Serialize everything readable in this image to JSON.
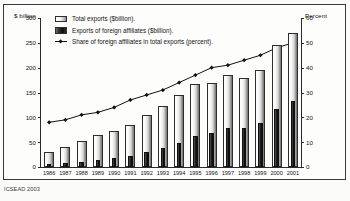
{
  "figure": {
    "left_axis_title": "$ billion",
    "right_axis_title": "Percent",
    "footer_note": "ICSEAD 2003"
  },
  "legend": {
    "items": [
      {
        "key": "total",
        "label": "Total exports ($billion)."
      },
      {
        "key": "affiliates",
        "label": "Exports of foreign affiliates ($billion)."
      },
      {
        "key": "share",
        "label": "Share of foreign affiliates in total exports (percent)."
      }
    ]
  },
  "chart_data": {
    "type": "bar",
    "title": "",
    "xlabel": "",
    "ylabel": "$ billion",
    "y2label": "Percent",
    "ylim": [
      0,
      300
    ],
    "y2lim": [
      0,
      60
    ],
    "yticks": [
      0,
      50,
      100,
      150,
      200,
      250,
      300
    ],
    "y2ticks": [
      0,
      10,
      20,
      30,
      40,
      50,
      60
    ],
    "grid": false,
    "legend_position": "top-left",
    "categories": [
      "1986",
      "1987",
      "1988",
      "1989",
      "1990",
      "1991",
      "1992",
      "1993",
      "1994",
      "1995",
      "1996",
      "1997",
      "1998",
      "1999",
      "2000",
      "2001"
    ],
    "series": [
      {
        "name": "Total exports ($billion).",
        "type": "bar",
        "axis": "left",
        "values": [
          31,
          40,
          52,
          64,
          73,
          85,
          104,
          122,
          145,
          168,
          170,
          185,
          180,
          195,
          245,
          270
        ]
      },
      {
        "name": "Exports of foreign affiliates ($billion).",
        "type": "bar",
        "axis": "left",
        "values": [
          6,
          8,
          11,
          14,
          18,
          23,
          30,
          38,
          49,
          62,
          68,
          79,
          78,
          88,
          117,
          133
        ]
      },
      {
        "name": "Share of foreign affiliates in total exports (percent).",
        "type": "line",
        "axis": "right",
        "values": [
          18,
          19,
          21,
          22,
          24,
          27,
          29,
          31,
          34,
          37,
          40,
          41,
          43,
          45,
          48,
          50
        ]
      }
    ]
  }
}
